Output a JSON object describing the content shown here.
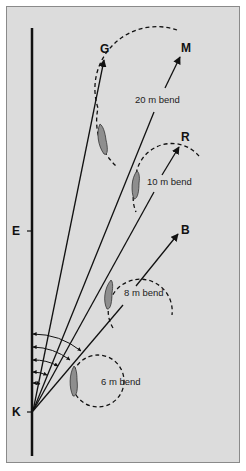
{
  "diagram": {
    "background": "#dcdcdc",
    "line_color": "#111111",
    "horse_fill": "#8e8e8e",
    "markers": {
      "K": "K",
      "E": "E",
      "G": "G",
      "M": "M",
      "R": "R",
      "B": "B"
    },
    "bends": [
      {
        "label": "20 m bend",
        "radius_m": 20
      },
      {
        "label": "10 m bend",
        "radius_m": 10
      },
      {
        "label": "8 m bend",
        "radius_m": 8
      },
      {
        "label": "6 m bend",
        "radius_m": 6
      }
    ],
    "lines_from": "K",
    "lines_to": [
      "G",
      "M",
      "R",
      "B"
    ]
  }
}
